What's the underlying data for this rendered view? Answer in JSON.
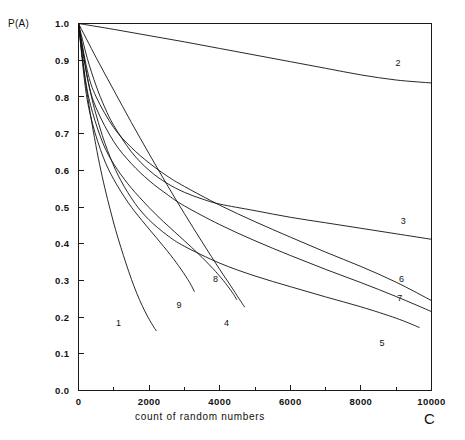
{
  "chart_data": {
    "type": "line",
    "title": "",
    "xlabel": "count of random numbers",
    "ylabel": "P(A)",
    "x_axis_symbol": "C",
    "xlim": [
      0,
      10000
    ],
    "ylim": [
      0.0,
      1.0
    ],
    "grid": false,
    "legend_position": "inline-end-labels",
    "x_major_ticks": [
      0,
      2000,
      4000,
      6000,
      8000,
      10000
    ],
    "x_major_tick_labels": [
      "0",
      "2000",
      "4000",
      "6000",
      "8000",
      "10000"
    ],
    "x_minor_tick_step": 1000,
    "y_ticks": [
      0.0,
      0.1,
      0.2,
      0.3,
      0.4,
      0.5,
      0.6,
      0.7,
      0.8,
      0.9,
      1.0
    ],
    "y_tick_labels": [
      "0.0",
      "0.1",
      "0.2",
      "0.3",
      "0.4",
      "0.5",
      "0.6",
      "0.7",
      "0.8",
      "0.9",
      "1.0"
    ],
    "line_color": "#111111",
    "series": [
      {
        "name": "1",
        "label": "1",
        "label_x": 1130,
        "label_y": 0.175,
        "points": [
          [
            0,
            1.0
          ],
          [
            150,
            0.875
          ],
          [
            300,
            0.775
          ],
          [
            450,
            0.69
          ],
          [
            600,
            0.615
          ],
          [
            750,
            0.55
          ],
          [
            900,
            0.492
          ],
          [
            1050,
            0.438
          ],
          [
            1200,
            0.39
          ],
          [
            1350,
            0.345
          ],
          [
            1500,
            0.303
          ],
          [
            1650,
            0.265
          ],
          [
            1800,
            0.232
          ],
          [
            1950,
            0.203
          ],
          [
            2100,
            0.178
          ],
          [
            2200,
            0.163
          ]
        ]
      },
      {
        "name": "2",
        "label": "2",
        "label_x": 9050,
        "label_y": 0.885,
        "points": [
          [
            0,
            1.0
          ],
          [
            1000,
            0.984
          ],
          [
            2000,
            0.967
          ],
          [
            3000,
            0.95
          ],
          [
            4000,
            0.932
          ],
          [
            5000,
            0.914
          ],
          [
            6000,
            0.896
          ],
          [
            7000,
            0.878
          ],
          [
            8000,
            0.86
          ],
          [
            9000,
            0.846
          ],
          [
            10000,
            0.838
          ]
        ]
      },
      {
        "name": "3",
        "label": "3",
        "label_x": 9200,
        "label_y": 0.455,
        "points": [
          [
            0,
            1.0
          ],
          [
            250,
            0.905
          ],
          [
            500,
            0.83
          ],
          [
            750,
            0.77
          ],
          [
            1000,
            0.722
          ],
          [
            1500,
            0.65
          ],
          [
            2000,
            0.6
          ],
          [
            2500,
            0.565
          ],
          [
            3000,
            0.54
          ],
          [
            3500,
            0.522
          ],
          [
            4000,
            0.508
          ],
          [
            5000,
            0.49
          ],
          [
            6000,
            0.472
          ],
          [
            7000,
            0.457
          ],
          [
            8000,
            0.442
          ],
          [
            9000,
            0.427
          ],
          [
            10000,
            0.412
          ]
        ]
      },
      {
        "name": "4",
        "label": "4",
        "label_x": 4190,
        "label_y": 0.175,
        "points": [
          [
            0,
            1.0
          ],
          [
            500,
            0.907
          ],
          [
            1000,
            0.818
          ],
          [
            1500,
            0.73
          ],
          [
            2000,
            0.645
          ],
          [
            2500,
            0.562
          ],
          [
            3000,
            0.482
          ],
          [
            3500,
            0.405
          ],
          [
            4000,
            0.33
          ],
          [
            4300,
            0.287
          ],
          [
            4550,
            0.25
          ],
          [
            4700,
            0.228
          ]
        ]
      },
      {
        "name": "5",
        "label": "5",
        "label_x": 8600,
        "label_y": 0.122,
        "points": [
          [
            0,
            1.0
          ],
          [
            300,
            0.83
          ],
          [
            600,
            0.718
          ],
          [
            900,
            0.635
          ],
          [
            1200,
            0.572
          ],
          [
            1600,
            0.51
          ],
          [
            2000,
            0.465
          ],
          [
            2500,
            0.424
          ],
          [
            3000,
            0.393
          ],
          [
            4000,
            0.347
          ],
          [
            5000,
            0.312
          ],
          [
            6000,
            0.283
          ],
          [
            7000,
            0.255
          ],
          [
            8000,
            0.228
          ],
          [
            9000,
            0.197
          ],
          [
            9650,
            0.172
          ]
        ]
      },
      {
        "name": "6",
        "label": "6",
        "label_x": 9150,
        "label_y": 0.295,
        "points": [
          [
            0,
            1.0
          ],
          [
            250,
            0.872
          ],
          [
            500,
            0.8
          ],
          [
            1000,
            0.716
          ],
          [
            1500,
            0.662
          ],
          [
            2000,
            0.62
          ],
          [
            2500,
            0.585
          ],
          [
            3000,
            0.556
          ],
          [
            4000,
            0.505
          ],
          [
            5000,
            0.46
          ],
          [
            6000,
            0.418
          ],
          [
            7000,
            0.377
          ],
          [
            8000,
            0.338
          ],
          [
            9000,
            0.295
          ],
          [
            10000,
            0.245
          ]
        ]
      },
      {
        "name": "7",
        "label": "7",
        "label_x": 9100,
        "label_y": 0.245,
        "points": [
          [
            0,
            1.0
          ],
          [
            250,
            0.852
          ],
          [
            500,
            0.77
          ],
          [
            1000,
            0.678
          ],
          [
            1500,
            0.618
          ],
          [
            2000,
            0.572
          ],
          [
            2500,
            0.535
          ],
          [
            3000,
            0.503
          ],
          [
            4000,
            0.452
          ],
          [
            5000,
            0.408
          ],
          [
            6000,
            0.368
          ],
          [
            7000,
            0.33
          ],
          [
            8000,
            0.294
          ],
          [
            9000,
            0.256
          ],
          [
            10000,
            0.215
          ]
        ]
      },
      {
        "name": "8",
        "label": "8",
        "label_x": 3880,
        "label_y": 0.295,
        "points": [
          [
            0,
            1.0
          ],
          [
            200,
            0.845
          ],
          [
            400,
            0.757
          ],
          [
            700,
            0.672
          ],
          [
            1000,
            0.617
          ],
          [
            1400,
            0.563
          ],
          [
            1800,
            0.519
          ],
          [
            2200,
            0.479
          ],
          [
            2600,
            0.443
          ],
          [
            3000,
            0.408
          ],
          [
            3400,
            0.372
          ],
          [
            3800,
            0.333
          ],
          [
            4100,
            0.3
          ],
          [
            4350,
            0.268
          ],
          [
            4480,
            0.248
          ]
        ]
      },
      {
        "name": "9",
        "label": "9",
        "label_x": 2850,
        "label_y": 0.225,
        "points": [
          [
            0,
            1.0
          ],
          [
            200,
            0.822
          ],
          [
            400,
            0.726
          ],
          [
            700,
            0.636
          ],
          [
            1000,
            0.575
          ],
          [
            1400,
            0.513
          ],
          [
            1800,
            0.463
          ],
          [
            2200,
            0.417
          ],
          [
            2600,
            0.37
          ],
          [
            2900,
            0.331
          ],
          [
            3150,
            0.294
          ],
          [
            3280,
            0.27
          ]
        ]
      }
    ]
  }
}
